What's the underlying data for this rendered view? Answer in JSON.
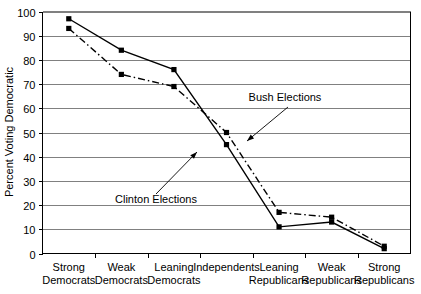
{
  "chart_data": {
    "type": "line",
    "title": "",
    "xlabel": "",
    "ylabel": "Percent Voting Democratic",
    "categories": [
      "Strong Democrats",
      "Weak Democrats",
      "Leaning Democrats",
      "Independents",
      "Leaning Republicans",
      "Weak Republicans",
      "Strong Republicans"
    ],
    "category_lines": [
      [
        "Strong",
        "Democrats"
      ],
      [
        "Weak",
        "Democrats"
      ],
      [
        "Leaning",
        "Democrats"
      ],
      [
        "Independents",
        ""
      ],
      [
        "Leaning",
        "Republicans"
      ],
      [
        "Weak",
        "Republicans"
      ],
      [
        "Strong",
        "Republicans"
      ]
    ],
    "ylim": [
      0,
      100
    ],
    "yticks": [
      0,
      10,
      20,
      30,
      40,
      50,
      60,
      70,
      80,
      90,
      100
    ],
    "grid": true,
    "legend_position": "inline-annotations",
    "series": [
      {
        "name": "Bush Elections",
        "style": "solid",
        "marker": "square",
        "values": [
          97,
          84,
          76,
          45,
          11,
          13,
          2
        ]
      },
      {
        "name": "Clinton Elections",
        "style": "dash-dot",
        "marker": "square",
        "values": [
          93,
          74,
          69,
          50,
          17,
          15,
          3
        ]
      }
    ],
    "annotations": [
      {
        "text": "Bush Elections",
        "label_x": 285,
        "label_y": 101,
        "arrow_from_x": 288,
        "arrow_from_y": 107,
        "arrow_to_x": 247,
        "arrow_to_y": 141
      },
      {
        "text": "Clinton Elections",
        "label_x": 156,
        "label_y": 203,
        "arrow_from_x": 156,
        "arrow_from_y": 194,
        "arrow_to_x": 197,
        "arrow_to_y": 152
      }
    ]
  },
  "colors": {
    "axis": "#000000",
    "grid": "#808080",
    "series": "#000000",
    "background": "#ffffff"
  }
}
